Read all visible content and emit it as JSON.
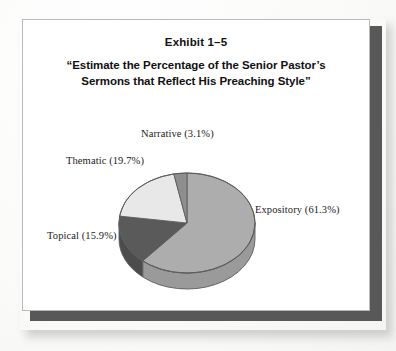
{
  "page": {
    "background_color": "#fdfdfc"
  },
  "exhibit": {
    "frame_border_color": "#b9b9b9",
    "shadow_color": "#4a4a4a",
    "number": "Exhibit 1–5",
    "title_line_1": "“Estimate the Percentage of the Senior Pastor’s",
    "title_line_2": "Sermons that Reflect His Preaching Style”"
  },
  "labels": {
    "narrative": "Narrative (3.1%)",
    "thematic": "Thematic (19.7%)",
    "topical": "Topical (15.9%)",
    "expository": "Expository (61.3%)"
  },
  "chart_data": {
    "type": "pie",
    "title": "Exhibit 1–5 “Estimate the Percentage of the Senior Pastor’s Sermons that Reflect His Preaching Style”",
    "categories": [
      "Expository",
      "Topical",
      "Thematic",
      "Narrative"
    ],
    "values": [
      61.3,
      15.9,
      19.7,
      3.1
    ],
    "unit": "percent",
    "total": 100.0,
    "slice_colors": [
      "#adadad",
      "#5a5a5a",
      "#e8e8e8",
      "#8e8e8e"
    ],
    "side_colors": [
      "#9a9a9a",
      "#4c4c4c",
      "#d2d2d2",
      "#7d7d7d"
    ],
    "outline_color": "#5d5d5d",
    "labels": [
      "Expository (61.3%)",
      "Topical (15.9%)",
      "Thematic (19.7%)",
      "Narrative (3.1%)"
    ],
    "legend": "none",
    "legend_position": "outside-labels",
    "grid": false,
    "three_d": true,
    "start_angle_deg": 0,
    "direction": "clockwise",
    "depth_px": 16
  }
}
